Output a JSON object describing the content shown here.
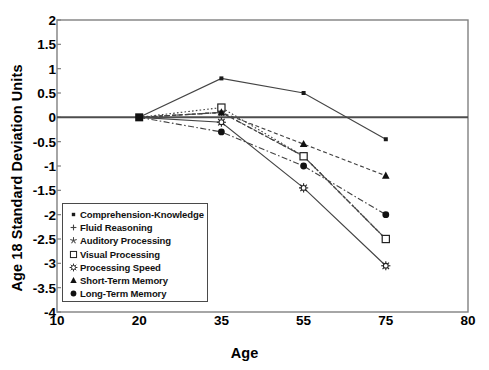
{
  "chart_data": {
    "type": "line",
    "title": "",
    "xlabel": "Age",
    "ylabel": "Age 18 Standard Deviation Units",
    "x": [
      20,
      35,
      55,
      75
    ],
    "x_tick_labels": [
      "10",
      "20",
      "35",
      "55",
      "75",
      "80"
    ],
    "x_tick_values": [
      10,
      20,
      35,
      55,
      75,
      80
    ],
    "xlim": [
      10,
      80
    ],
    "y_tick_labels": [
      "2",
      "1.5",
      "1",
      "0.5",
      "0",
      "-0.5",
      "-1",
      "-1.5",
      "-2",
      "-2.5",
      "-3",
      "-3.5",
      "-4"
    ],
    "y_tick_values": [
      2,
      1.5,
      1,
      0.5,
      0,
      -0.5,
      -1,
      -1.5,
      -2,
      -2.5,
      -3,
      -3.5,
      -4
    ],
    "ylim": [
      -4,
      2
    ],
    "grid": false,
    "legend_position": "inside-lower-left",
    "series": [
      {
        "name": "Comprehension-Knowledge",
        "marker": "small-dot",
        "line_style": "solid",
        "values": [
          0,
          0.8,
          0.5,
          -0.45
        ]
      },
      {
        "name": "Fluid Reasoning",
        "marker": "plus",
        "line_style": "dash-dot",
        "values": [
          0,
          0.1,
          -0.8,
          -2.5
        ]
      },
      {
        "name": "Auditory Processing",
        "marker": "asterisk-star",
        "line_style": "dashed",
        "values": [
          0,
          0.1,
          -0.8,
          -2.5
        ]
      },
      {
        "name": "Visual Processing",
        "marker": "open-square",
        "line_style": "dotted",
        "values": [
          0,
          0.2,
          -0.8,
          -2.5
        ]
      },
      {
        "name": "Processing Speed",
        "marker": "sun-star",
        "line_style": "solid",
        "values": [
          0,
          -0.1,
          -1.45,
          -3.05
        ]
      },
      {
        "name": "Short-Term Memory",
        "marker": "filled-triangle",
        "line_style": "dashed",
        "values": [
          0,
          0.1,
          -0.55,
          -1.2
        ]
      },
      {
        "name": "Long-Term Memory",
        "marker": "filled-circle",
        "line_style": "dash-dot",
        "values": [
          0,
          -0.3,
          -1.0,
          -2.0
        ]
      }
    ],
    "colors": {
      "line": "#444444",
      "axis": "#808080",
      "zero_line": "#4d4d4d",
      "text": "#000000",
      "background": "#ffffff"
    }
  }
}
